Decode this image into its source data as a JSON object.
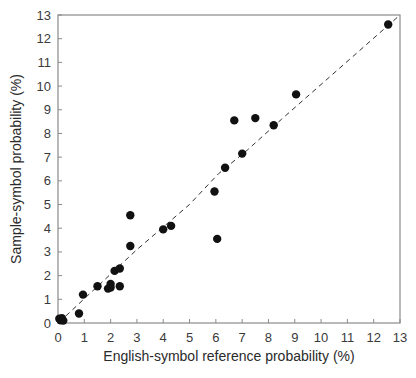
{
  "chart_data": {
    "type": "scatter",
    "title": "",
    "xlabel": "English-symbol reference probability (%)",
    "ylabel": "Sample-symbol probability (%)",
    "xlim": [
      0,
      13
    ],
    "ylim": [
      0,
      13
    ],
    "xticks": [
      0,
      1,
      2,
      3,
      4,
      5,
      6,
      7,
      8,
      9,
      10,
      11,
      12,
      13
    ],
    "yticks": [
      0,
      1,
      2,
      3,
      4,
      5,
      6,
      7,
      8,
      9,
      10,
      11,
      12,
      13
    ],
    "grid": false,
    "legend": null,
    "reference_line": {
      "style": "dashed",
      "description": "approximate y = x trend",
      "color": "#333333"
    },
    "marker_color": "#111111",
    "series": [
      {
        "name": "symbols",
        "points": [
          {
            "x": 0.05,
            "y": 0.18
          },
          {
            "x": 0.1,
            "y": 0.12
          },
          {
            "x": 0.15,
            "y": 0.2
          },
          {
            "x": 0.2,
            "y": 0.1
          },
          {
            "x": 0.8,
            "y": 0.4
          },
          {
            "x": 0.95,
            "y": 1.2
          },
          {
            "x": 1.5,
            "y": 1.55
          },
          {
            "x": 1.9,
            "y": 1.45
          },
          {
            "x": 2.0,
            "y": 1.5
          },
          {
            "x": 2.0,
            "y": 1.65
          },
          {
            "x": 2.15,
            "y": 2.2
          },
          {
            "x": 2.35,
            "y": 2.3
          },
          {
            "x": 2.35,
            "y": 1.55
          },
          {
            "x": 2.75,
            "y": 3.25
          },
          {
            "x": 2.75,
            "y": 4.55
          },
          {
            "x": 4.0,
            "y": 3.95
          },
          {
            "x": 4.3,
            "y": 4.1
          },
          {
            "x": 5.95,
            "y": 5.55
          },
          {
            "x": 6.05,
            "y": 3.55
          },
          {
            "x": 6.35,
            "y": 6.55
          },
          {
            "x": 6.7,
            "y": 8.55
          },
          {
            "x": 7.0,
            "y": 7.15
          },
          {
            "x": 7.5,
            "y": 8.65
          },
          {
            "x": 8.2,
            "y": 8.35
          },
          {
            "x": 9.05,
            "y": 9.65
          },
          {
            "x": 12.55,
            "y": 12.6
          }
        ]
      }
    ],
    "reference_path": [
      {
        "x": 0.3,
        "y": 0.3
      },
      {
        "x": 3.0,
        "y": 3.1
      },
      {
        "x": 5.0,
        "y": 5.0
      },
      {
        "x": 6.1,
        "y": 6.3
      },
      {
        "x": 7.2,
        "y": 7.3
      },
      {
        "x": 8.5,
        "y": 8.6
      },
      {
        "x": 13.0,
        "y": 13.0
      }
    ]
  }
}
